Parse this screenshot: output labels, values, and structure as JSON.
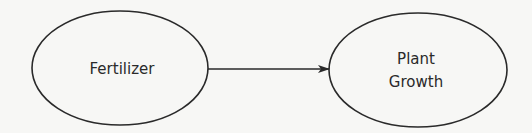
{
  "diagram": {
    "nodes": [
      {
        "id": "fertilizer",
        "label_lines": [
          "Fertilizer"
        ]
      },
      {
        "id": "plant-growth",
        "label_lines": [
          "Plant",
          "Growth"
        ]
      }
    ],
    "edges": [
      {
        "from": "fertilizer",
        "to": "plant-growth",
        "type": "arrow"
      }
    ],
    "colors": {
      "stroke": "#2a2a2a",
      "background": "#f7f7f5"
    }
  }
}
